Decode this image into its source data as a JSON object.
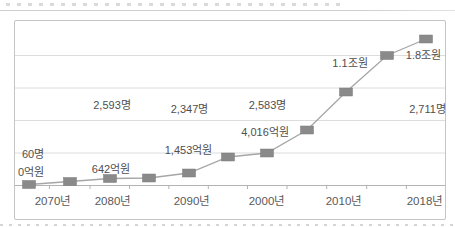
{
  "figure": {
    "background": "#ffffff",
    "frame_border_color": "#c5c5c5",
    "top_rule_color": "#cfcfcf"
  },
  "chart_data": {
    "type": "line",
    "title": "",
    "x_tick_labels": [
      "2070년",
      "2080년",
      "2090년",
      "2000년",
      "2010년",
      "2018년"
    ],
    "x_tick_label_centers": [
      38,
      98,
      177,
      252,
      329,
      410
    ],
    "grid": true,
    "legend": "none",
    "gridlines_y": [
      34.5,
      67,
      99.5,
      132
    ],
    "axis_y": 164.5,
    "tick_xs": [
      34.4,
      75,
      114.5,
      153.8,
      193.3,
      232.5,
      272,
      311.7,
      351.7,
      391.4
    ],
    "grid_color": "#dcdcdc",
    "axis_color": "#b3b3b3",
    "label_color": "#4f4f4f",
    "series": [
      {
        "name": "workforce-and-production-trend",
        "line_color": "#a6a6a6",
        "marker_color": "#8a8a8a",
        "marker_w": 13,
        "marker_h": 8,
        "points_px": [
          [
            14,
            163.5
          ],
          [
            55,
            160.5
          ],
          [
            95,
            157.5
          ],
          [
            134,
            157
          ],
          [
            174,
            152
          ],
          [
            213,
            136
          ],
          [
            252,
            132
          ],
          [
            292,
            109
          ],
          [
            331,
            71
          ],
          [
            372,
            34.5
          ],
          [
            411,
            18
          ]
        ]
      }
    ],
    "annotations": [
      {
        "text": "60명",
        "x": 7,
        "y": 127,
        "align": "left"
      },
      {
        "text": "0억원",
        "x": 3,
        "y": 144.5,
        "align": "left"
      },
      {
        "text": "642억원",
        "x": 96,
        "y": 142,
        "align": "center"
      },
      {
        "text": "2,593명",
        "x": 97,
        "y": 78,
        "align": "center"
      },
      {
        "text": "2,347명",
        "x": 174.5,
        "y": 82,
        "align": "center"
      },
      {
        "text": "1,453억원",
        "x": 173.5,
        "y": 123,
        "align": "center"
      },
      {
        "text": "4,016억원",
        "x": 250,
        "y": 105,
        "align": "center"
      },
      {
        "text": "2,583명",
        "x": 252.5,
        "y": 78,
        "align": "center"
      },
      {
        "text": "1.1조원",
        "x": 335,
        "y": 36,
        "align": "center"
      },
      {
        "text": "1.8조원",
        "x": 408.5,
        "y": 28,
        "align": "center"
      },
      {
        "text": "2,711명",
        "x": 412.5,
        "y": 82,
        "align": "center"
      }
    ]
  }
}
